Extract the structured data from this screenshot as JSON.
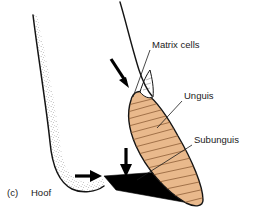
{
  "figure": {
    "caption_letter": "(c)",
    "caption_title": "Hoof",
    "background_color": "#ffffff"
  },
  "labels": [
    {
      "id": "matrix-cells",
      "text": "Matrix cells",
      "x": 152,
      "y": 48
    },
    {
      "id": "unguis",
      "text": "Unguis",
      "x": 184,
      "y": 99
    },
    {
      "id": "subunguis",
      "text": "Subunguis",
      "x": 194,
      "y": 143
    }
  ],
  "structures": {
    "digit": {
      "name": "digit-outline",
      "outline_color": "#141414",
      "fill_color": "#ffffff",
      "stipple_color": "#555555"
    },
    "unguis": {
      "name": "unguis-plate",
      "fill_color": "#E9B98C",
      "outline_color": "#141414",
      "hatch_color": "#8a5a33"
    },
    "subunguis": {
      "name": "subunguis-wedge",
      "fill_color": "#000000"
    },
    "matrix": {
      "name": "matrix-cells-region",
      "fill_color": "#ffffff",
      "outline_color": "#141414"
    }
  },
  "arrows": [
    {
      "id": "arrow-matrix-down",
      "direction": "down-right",
      "color": "#000000"
    },
    {
      "id": "arrow-subunguis-down",
      "direction": "down",
      "color": "#000000"
    },
    {
      "id": "arrow-pad-right",
      "direction": "right",
      "color": "#000000"
    }
  ]
}
